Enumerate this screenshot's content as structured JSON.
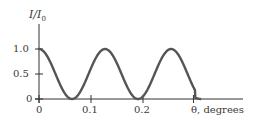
{
  "chart_data": {
    "type": "line",
    "title": "",
    "xlabel": "θ, degrees",
    "ylabel": "I/I0",
    "ylabel_main": "I/I",
    "ylabel_sub": "0",
    "xlim": [
      0,
      0.31
    ],
    "ylim": [
      0,
      1.0
    ],
    "x_ticks": [
      0,
      0.1,
      0.2
    ],
    "x_tick_labels": [
      "0",
      "0.1",
      "0.2"
    ],
    "y_ticks": [
      0,
      0.5,
      1.0
    ],
    "y_tick_labels": [
      "0",
      "0.5",
      "1.0"
    ],
    "grid": false,
    "legend": null,
    "series": [
      {
        "name": "I/I0 (cos² interference)",
        "period_deg": 0.127,
        "x": [
          0,
          0.032,
          0.063,
          0.095,
          0.127,
          0.159,
          0.19,
          0.222,
          0.254,
          0.286,
          0.3,
          0.31
        ],
        "y": [
          1.0,
          0.5,
          0.0,
          0.5,
          1.0,
          0.5,
          0.0,
          0.5,
          1.0,
          0.5,
          0.02,
          0.0
        ]
      }
    ]
  },
  "colors": {
    "curve": "#555555",
    "axis": "#333333"
  }
}
